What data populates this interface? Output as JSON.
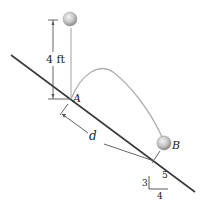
{
  "diagram": {
    "height_label": "4 ft",
    "point_a_label": "A",
    "point_b_label": "B",
    "distance_label": "d",
    "slope": {
      "rise": "3",
      "run": "4",
      "hyp": "5"
    },
    "colors": {
      "incline": "#3a3a3a",
      "guide": "#9a9a9a",
      "trajectory": "#b0b0b0",
      "ball": "#c8c8c8"
    }
  }
}
